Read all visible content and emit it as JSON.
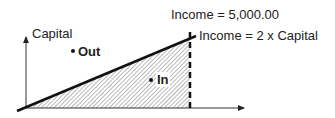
{
  "diagram": {
    "y_axis_label": "Capital",
    "point_out_label": "Out",
    "point_in_label": "In",
    "vertical_line_label": "Income = 5,000.00",
    "diagonal_line_label": "Income = 2 x Capital",
    "colors": {
      "stroke": "#111111",
      "hatch": "#777777",
      "text": "#222222"
    }
  }
}
